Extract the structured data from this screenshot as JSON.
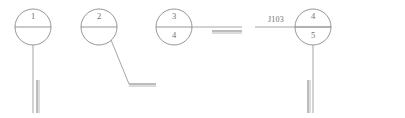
{
  "diagram": {
    "type": "weld-joint-callout-drawing",
    "background_color": "#ffffff",
    "line_color": "#8a8a8a",
    "text_color": "#6f6f6f",
    "balloons": [
      {
        "id": "balloon-1",
        "top_label": "1",
        "bottom_label": "",
        "cx": 33,
        "cy": 27,
        "r": 18
      },
      {
        "id": "balloon-2",
        "top_label": "2",
        "bottom_label": "",
        "cx": 99,
        "cy": 27,
        "r": 18
      },
      {
        "id": "balloon-3",
        "top_label": "3",
        "bottom_label": "4",
        "cx": 174,
        "cy": 27,
        "r": 18
      },
      {
        "id": "balloon-4",
        "top_label": "4",
        "bottom_label": "5",
        "cx": 313,
        "cy": 27,
        "r": 18
      }
    ],
    "tags": [
      {
        "id": "tag-j103",
        "label": "J103",
        "x": 276,
        "y": 20
      }
    ]
  }
}
